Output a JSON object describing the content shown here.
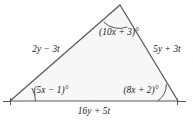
{
  "figure": {
    "kind": "triangle-geometry-diagram",
    "fill_color": "#f7f7f7",
    "stroke_color": "#58585a",
    "text_color": "#1a1a1a",
    "background_color": "#ffffff",
    "vertices": {
      "apex": {
        "x": 120,
        "y": 5
      },
      "bottom_left": {
        "x": 10,
        "y": 101
      },
      "bottom_right": {
        "x": 178,
        "y": 101
      }
    },
    "angles": [
      {
        "id": "apex",
        "label": "(10x + 3)°",
        "arcs": 1
      },
      {
        "id": "bottom-left",
        "label": "(5x − 1)°",
        "arcs": 1
      },
      {
        "id": "bottom-right",
        "label": "(8x + 2)°",
        "arcs": 1
      }
    ],
    "sides": [
      {
        "id": "left",
        "label": "2y − 3t"
      },
      {
        "id": "right",
        "label": "5y + 3t"
      },
      {
        "id": "bottom",
        "label": "16y + 5t"
      }
    ],
    "labels": {
      "angle_apex": "(10x + 3)°",
      "angle_bottom_left": "(5x − 1)°",
      "angle_bottom_right": "(8x + 2)°",
      "side_left": "2y − 3t",
      "side_right": "5y + 3t",
      "side_bottom": "16y + 5t"
    }
  }
}
